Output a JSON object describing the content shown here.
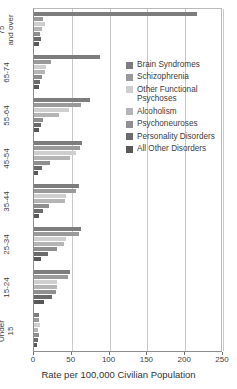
{
  "chart_data": {
    "type": "bar",
    "orientation": "horizontal",
    "title": "",
    "subtitle": "",
    "xlabel": "Rate per 100,000 Civilian Population",
    "ylabel": "",
    "xlim": [
      0,
      250
    ],
    "ylim": null,
    "xticks": [
      0,
      50,
      100,
      150,
      200,
      250
    ],
    "xticklabels": [
      "0",
      "50",
      "100",
      "150",
      "200",
      "250"
    ],
    "grid": true,
    "grid_axis": "x",
    "legend_position": "inside-right",
    "categories": [
      "75 and over",
      "65-74",
      "55-64",
      "45-54",
      "35-44",
      "25-34",
      "15-24",
      "Under 15"
    ],
    "category_labels_multiline": [
      [
        "75",
        "and over"
      ],
      [
        "65-74"
      ],
      [
        "55-64"
      ],
      [
        "45-54"
      ],
      [
        "35-44"
      ],
      [
        "25-34"
      ],
      [
        "15-24"
      ],
      [
        "Under",
        "15"
      ]
    ],
    "series": [
      {
        "name": "Brain Syndromes",
        "color": "#7d7d7d",
        "values": [
          215,
          87,
          74,
          64,
          60,
          62,
          47,
          7
        ]
      },
      {
        "name": "Schizophrenia",
        "color": "#9a9a9a",
        "values": [
          12,
          22,
          62,
          61,
          56,
          59,
          45,
          6
        ]
      },
      {
        "name": "Other Functional Psychoses",
        "color": "#cfcfcf",
        "values": [
          14,
          16,
          46,
          55,
          42,
          42,
          31,
          8
        ]
      },
      {
        "name": "Alcoholism",
        "color": "#b5b5b5",
        "values": [
          11,
          15,
          33,
          47,
          41,
          40,
          30,
          5
        ]
      },
      {
        "name": "Psychoneuroses",
        "color": "#8f8f8f",
        "values": [
          8,
          10,
          12,
          21,
          20,
          30,
          29,
          6
        ]
      },
      {
        "name": "Personality Disorders",
        "color": "#6b6b6b",
        "values": [
          9,
          8,
          9,
          11,
          12,
          19,
          24,
          5
        ]
      },
      {
        "name": "All Other Disorders",
        "color": "#585858",
        "values": [
          7,
          6,
          6,
          5,
          7,
          9,
          13,
          4
        ]
      }
    ]
  },
  "legend": {
    "entries": [
      {
        "label": "Brain Syndromes",
        "color": "#7d7d7d"
      },
      {
        "label": "Schizophrenia",
        "color": "#9a9a9a"
      },
      {
        "label": "Other Functional Psychoses",
        "color": "#cfcfcf"
      },
      {
        "label": "Alcoholism",
        "color": "#b5b5b5"
      },
      {
        "label": "Psychoneuroses",
        "color": "#8f8f8f"
      },
      {
        "label": "Personality Disorders",
        "color": "#6b6b6b"
      },
      {
        "label": "All Other Disorders",
        "color": "#585858"
      }
    ]
  },
  "axis": {
    "x_title": "Rate per 100,000 Civilian Population",
    "x_tick_labels": [
      "0",
      "50",
      "100",
      "150",
      "200",
      "250"
    ],
    "y_tick_labels": [
      "75 and over",
      "65-74",
      "55-64",
      "45-54",
      "35-44",
      "25-34",
      "15-24",
      "Under 15"
    ]
  }
}
